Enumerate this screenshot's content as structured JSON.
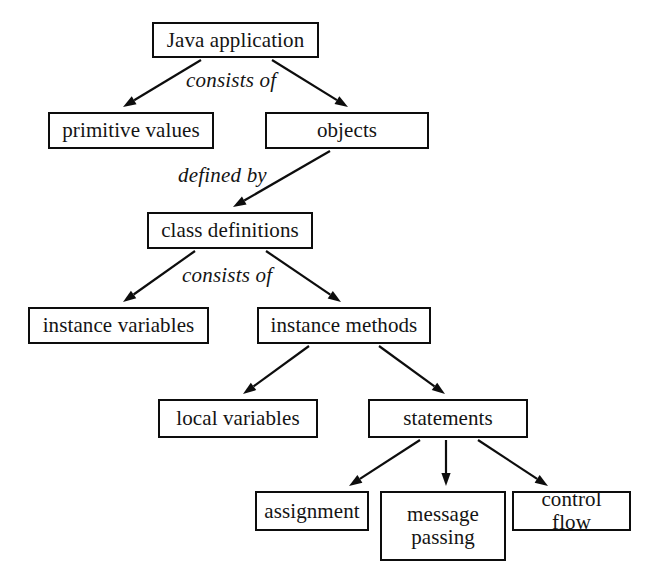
{
  "diagram": {
    "background_color": "#ffffff",
    "line_color": "#0d0d0d",
    "text_color": "#141414",
    "nodes": [
      {
        "id": "java-application",
        "label": "Java application",
        "x": 152,
        "y": 22,
        "w": 167,
        "h": 36
      },
      {
        "id": "primitive-values",
        "label": "primitive values",
        "x": 48,
        "y": 112,
        "w": 166,
        "h": 37
      },
      {
        "id": "objects",
        "label": "objects",
        "x": 265,
        "y": 112,
        "w": 164,
        "h": 37
      },
      {
        "id": "class-definitions",
        "label": "class definitions",
        "x": 147,
        "y": 212,
        "w": 166,
        "h": 37
      },
      {
        "id": "instance-variables",
        "label": "instance variables",
        "x": 28,
        "y": 307,
        "w": 181,
        "h": 37
      },
      {
        "id": "instance-methods",
        "label": "instance methods",
        "x": 257,
        "y": 307,
        "w": 174,
        "h": 37
      },
      {
        "id": "local-variables",
        "label": "local variables",
        "x": 158,
        "y": 399,
        "w": 160,
        "h": 39
      },
      {
        "id": "statements",
        "label": "statements",
        "x": 368,
        "y": 399,
        "w": 160,
        "h": 39
      },
      {
        "id": "assignment",
        "label": "assignment",
        "x": 255,
        "y": 491,
        "w": 114,
        "h": 40
      },
      {
        "id": "message-passing",
        "label": "message\npassing",
        "x": 380,
        "y": 491,
        "w": 126,
        "h": 70
      },
      {
        "id": "control-flow",
        "label": "control flow",
        "x": 512,
        "y": 491,
        "w": 119,
        "h": 40
      }
    ],
    "edge_labels": [
      {
        "id": "consists-of-top",
        "text": "consists of",
        "x": 186,
        "y": 68
      },
      {
        "id": "defined-by",
        "text": "defined by",
        "x": 178,
        "y": 163
      },
      {
        "id": "consists-of-middle",
        "text": "consists of",
        "x": 182,
        "y": 263
      }
    ],
    "edges": [
      {
        "id": "java-application-to-primitive-values",
        "from": "java application",
        "to": "primitive values",
        "x1": 201,
        "y1": 60,
        "x2": 123,
        "y2": 107
      },
      {
        "id": "java-application-to-objects",
        "from": "java application",
        "to": "objects",
        "x1": 272,
        "y1": 60,
        "x2": 348,
        "y2": 107
      },
      {
        "id": "objects-to-class-definitions",
        "from": "objects",
        "to": "class definitions",
        "x1": 330,
        "y1": 151,
        "x2": 233,
        "y2": 207
      },
      {
        "id": "class-definitions-to-instance-variables",
        "from": "class definitions",
        "to": "instance variables",
        "x1": 195,
        "y1": 251,
        "x2": 123,
        "y2": 302
      },
      {
        "id": "class-definitions-to-instance-methods",
        "from": "class definitions",
        "to": "instance methods",
        "x1": 266,
        "y1": 251,
        "x2": 341,
        "y2": 302
      },
      {
        "id": "instance-methods-to-local-variables",
        "from": "instance methods",
        "to": "local variables",
        "x1": 309,
        "y1": 346,
        "x2": 243,
        "y2": 394
      },
      {
        "id": "instance-methods-to-statements",
        "from": "instance methods",
        "to": "statements",
        "x1": 379,
        "y1": 346,
        "x2": 445,
        "y2": 394
      },
      {
        "id": "statements-to-assignment",
        "from": "statements",
        "to": "assignment",
        "x1": 420,
        "y1": 440,
        "x2": 349,
        "y2": 486
      },
      {
        "id": "statements-to-message-passing",
        "from": "statements",
        "to": "message passing",
        "x1": 446,
        "y1": 440,
        "x2": 446,
        "y2": 486
      },
      {
        "id": "statements-to-control-flow",
        "from": "statements",
        "to": "control flow",
        "x1": 478,
        "y1": 440,
        "x2": 548,
        "y2": 486
      }
    ],
    "caption": ""
  }
}
